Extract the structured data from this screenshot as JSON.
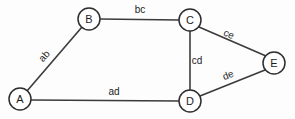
{
  "figure": {
    "kind": "undirected-graph-diagram",
    "background_color": "#fdfdfd",
    "stroke_color": "#3b3b3b",
    "node_fill_color": "#ffffff",
    "text_color": "#1c1c1c",
    "width": 295,
    "height": 119
  },
  "nodes": [
    {
      "id": "A",
      "label": "A",
      "cx": 20,
      "cy": 99,
      "r": 11
    },
    {
      "id": "B",
      "label": "B",
      "cx": 89,
      "cy": 19,
      "r": 11
    },
    {
      "id": "C",
      "label": "C",
      "cx": 190,
      "cy": 20,
      "r": 11
    },
    {
      "id": "D",
      "label": "D",
      "cx": 190,
      "cy": 101,
      "r": 11
    },
    {
      "id": "E",
      "label": "E",
      "cx": 274,
      "cy": 63,
      "r": 11
    }
  ],
  "edges": [
    {
      "id": "ab",
      "label": "ab",
      "from": "A",
      "to": "B",
      "x1": 27,
      "y1": 91,
      "x2": 82,
      "y2": 27,
      "label_x": 44,
      "label_y": 56,
      "label_rotation": -49
    },
    {
      "id": "bc",
      "label": "bc",
      "from": "B",
      "to": "C",
      "x1": 100,
      "y1": 19,
      "x2": 179,
      "y2": 20,
      "label_x": 140,
      "label_y": 9,
      "label_rotation": 0
    },
    {
      "id": "ce",
      "label": "ce",
      "from": "C",
      "to": "E",
      "x1": 199,
      "y1": 27,
      "x2": 266,
      "y2": 56,
      "label_x": 229,
      "label_y": 34,
      "label_rotation": 24
    },
    {
      "id": "cd",
      "label": "cd",
      "from": "C",
      "to": "D",
      "x1": 190,
      "y1": 31,
      "x2": 190,
      "y2": 90,
      "label_x": 197,
      "label_y": 60,
      "label_rotation": 0
    },
    {
      "id": "de",
      "label": "de",
      "from": "D",
      "to": "E",
      "x1": 200,
      "y1": 96,
      "x2": 265,
      "y2": 70,
      "label_x": 228,
      "label_y": 75,
      "label_rotation": -22
    },
    {
      "id": "ad",
      "label": "ad",
      "from": "A",
      "to": "D",
      "x1": 31,
      "y1": 100,
      "x2": 179,
      "y2": 101,
      "label_x": 114,
      "label_y": 91,
      "label_rotation": 0
    }
  ]
}
